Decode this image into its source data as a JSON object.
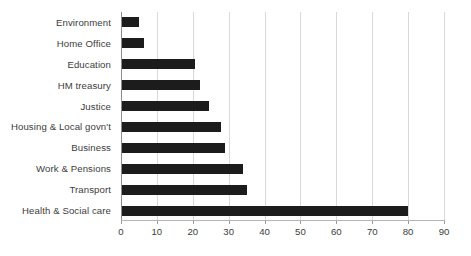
{
  "chart_data": {
    "type": "bar",
    "orientation": "horizontal",
    "title": "",
    "subtitle": "",
    "xlabel": "",
    "ylabel": "",
    "xlim": [
      0,
      90
    ],
    "ylim": null,
    "grid": true,
    "grid_axis": "x",
    "legend": false,
    "legend_position": "none",
    "categories": [
      "Environment",
      "Home Office",
      "Education",
      "HM treasury",
      "Justice",
      "Housing & Local govn't",
      "Business",
      "Work & Pensions",
      "Transport",
      "Health & Social care"
    ],
    "values": [
      5,
      6.5,
      20.5,
      22,
      24.5,
      28,
      29,
      34,
      35,
      80
    ],
    "xticks": [
      0,
      10,
      20,
      30,
      40,
      50,
      60,
      70,
      80,
      90
    ],
    "xtick_labels": [
      "0",
      "10",
      "20",
      "30",
      "40",
      "50",
      "60",
      "70",
      "80",
      "90"
    ],
    "bar_color": "#1c1c1c",
    "gridline_color": "#d9d9d9",
    "axis_color": "#8c8c8c",
    "label_color": "#3c3c3c",
    "background_color": "#ffffff"
  }
}
